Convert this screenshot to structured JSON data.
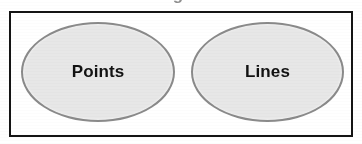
{
  "figure": {
    "type": "diagram",
    "clipped_caption_fragment": "g",
    "frame": {
      "border_color": "#141414",
      "background_color": "#ffffff"
    },
    "nodes": [
      {
        "id": "points",
        "label": "Points",
        "shape": "ellipse",
        "fill_color": "#e7e7e7",
        "stroke_color": "#8a8a8a",
        "text_color": "#121212"
      },
      {
        "id": "lines",
        "label": "Lines",
        "shape": "ellipse",
        "fill_color": "#e7e7e7",
        "stroke_color": "#8a8a8a",
        "text_color": "#121212"
      }
    ]
  }
}
